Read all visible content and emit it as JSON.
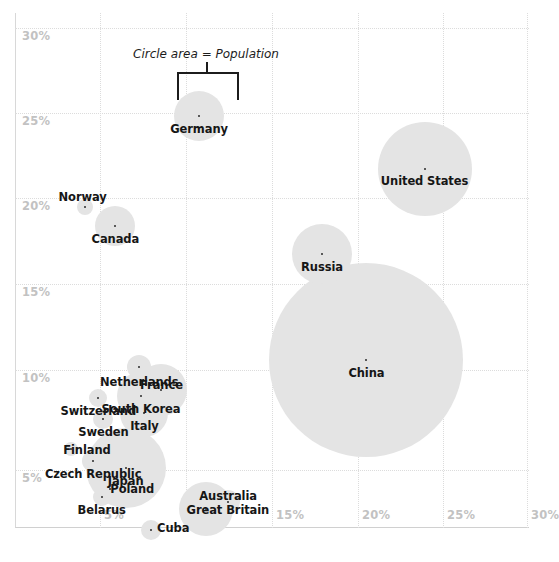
{
  "chart_data": {
    "type": "scatter",
    "title": "",
    "subtitle": "",
    "xlabel": "",
    "ylabel": "",
    "xlim": [
      2.5,
      32.0
    ],
    "ylim": [
      2.2,
      31.5
    ],
    "grid": true,
    "legend_position": "none",
    "annotations": [
      {
        "text": "Circle area = Population",
        "points_to": "Germany"
      }
    ],
    "x_ticks": [
      "5%",
      "10%",
      "15%",
      "20%",
      "25%",
      "30%"
    ],
    "y_ticks": [
      "30%",
      "25%",
      "20%",
      "15%",
      "10%",
      "5%"
    ],
    "size_encoding": "Circle area = Population",
    "points": [
      {
        "name": "Germany",
        "x": 10.8,
        "y": 25.0,
        "r": 25,
        "label_dx": 0,
        "label_dy": 6
      },
      {
        "name": "United States",
        "x": 24.0,
        "y": 22.0,
        "r": 47,
        "label_dx": 0,
        "label_dy": 5
      },
      {
        "name": "Russia",
        "x": 18.0,
        "y": 17.2,
        "r": 30,
        "label_dx": 0,
        "label_dy": 6
      },
      {
        "name": "Norway",
        "x": 4.1,
        "y": 19.9,
        "r": 8,
        "label_dx": -2,
        "label_dy": -17
      },
      {
        "name": "Canada",
        "x": 5.9,
        "y": 18.8,
        "r": 20,
        "label_dx": 0,
        "label_dy": 6
      },
      {
        "name": "China",
        "x": 20.6,
        "y": 11.2,
        "r": 97,
        "label_dx": 0,
        "label_dy": 6
      },
      {
        "name": "Netherlands",
        "x": 7.3,
        "y": 10.8,
        "r": 12,
        "label_dx": 0,
        "label_dy": 8
      },
      {
        "name": "Switzerland",
        "x": 4.9,
        "y": 9.1,
        "r": 9,
        "label_dx": 0,
        "label_dy": 6
      },
      {
        "name": "Sweden",
        "x": 5.2,
        "y": 7.9,
        "r": 10,
        "label_dx": 0,
        "label_dy": 6
      },
      {
        "name": "Finland",
        "x": 3.3,
        "y": 6.2,
        "r": 7,
        "label_dx": 16,
        "label_dy": -6
      },
      {
        "name": "France",
        "x": 8.6,
        "y": 9.5,
        "r": 26,
        "label_dx": 0,
        "label_dy": -12
      },
      {
        "name": "South Korea",
        "x": 7.4,
        "y": 9.2,
        "r": 24,
        "label_dx": 0,
        "label_dy": 6
      },
      {
        "name": "Italy",
        "x": 7.6,
        "y": 8.2,
        "r": 24,
        "label_dx": 0,
        "label_dy": 6
      },
      {
        "name": "Japan",
        "x": 6.5,
        "y": 5.1,
        "r": 40,
        "label_dx": 0,
        "label_dy": 6
      },
      {
        "name": "Czech Republic",
        "x": 4.6,
        "y": 5.5,
        "r": 11,
        "label_dx": 0,
        "label_dy": 6
      },
      {
        "name": "Poland",
        "x": 5.6,
        "y": 3.9,
        "r": 14,
        "label_dx": 22,
        "label_dy": -7
      },
      {
        "name": "Belarus",
        "x": 5.1,
        "y": 3.5,
        "r": 9,
        "label_dx": 0,
        "label_dy": 6
      },
      {
        "name": "Australia",
        "x": 12.5,
        "y": 3.2,
        "r": 12,
        "label_dx": 0,
        "label_dy": -13
      },
      {
        "name": "Great Britain",
        "x": 11.2,
        "y": 2.8,
        "r": 27,
        "label_dx": 22,
        "label_dy": -6
      },
      {
        "name": "Cuba",
        "x": 8.0,
        "y": 1.6,
        "r": 10,
        "label_dx": 22,
        "label_dy": -9
      }
    ]
  },
  "axes": {
    "x_ticks": [
      {
        "label": "5%",
        "px": 100
      },
      {
        "label": "10%",
        "px": 186
      },
      {
        "label": "15%",
        "px": 272
      },
      {
        "label": "20%",
        "px": 358
      },
      {
        "label": "25%",
        "px": 443
      },
      {
        "label": "30%",
        "px": 527
      }
    ],
    "y_ticks": [
      {
        "label": "30%",
        "py": 28
      },
      {
        "label": "25%",
        "py": 113
      },
      {
        "label": "20%",
        "py": 198
      },
      {
        "label": "15%",
        "py": 284
      },
      {
        "label": "10%",
        "py": 370
      },
      {
        "label": "5%",
        "py": 470
      }
    ]
  },
  "annotation": {
    "text": "Circle area = Population"
  },
  "style": {
    "bubble_fill": "#e4e4e4",
    "dot_color": "#2b2b2b",
    "label_color": "#161616",
    "tick_color": "#c2c2c2",
    "grid_color": "#dcdcdc",
    "background": "#ffffff"
  }
}
